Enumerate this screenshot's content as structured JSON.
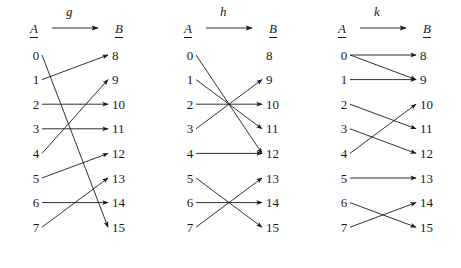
{
  "figure": {
    "domain_label": "A",
    "codomain_label": "B",
    "domain_values": [
      "0",
      "1",
      "2",
      "3",
      "4",
      "5",
      "6",
      "7"
    ],
    "codomain_values": [
      "8",
      "9",
      "10",
      "11",
      "12",
      "13",
      "14",
      "15"
    ],
    "stroke_color": "#1a1a1a",
    "background_color": "#ffffff"
  },
  "diagrams": [
    {
      "name": "g",
      "arrow_label": "g",
      "domain_label": "A",
      "codomain_label": "B",
      "domain_values": [
        "0",
        "1",
        "2",
        "3",
        "4",
        "5",
        "6",
        "7"
      ],
      "codomain_values": [
        "8",
        "9",
        "10",
        "11",
        "12",
        "13",
        "14",
        "15"
      ],
      "mappings": [
        {
          "from": "0",
          "to": "15"
        },
        {
          "from": "1",
          "to": "8"
        },
        {
          "from": "2",
          "to": "10"
        },
        {
          "from": "3",
          "to": "11"
        },
        {
          "from": "4",
          "to": "9"
        },
        {
          "from": "5",
          "to": "12"
        },
        {
          "from": "6",
          "to": "14"
        },
        {
          "from": "7",
          "to": "13"
        }
      ]
    },
    {
      "name": "h",
      "arrow_label": "h",
      "domain_label": "A",
      "codomain_label": "B",
      "domain_values": [
        "0",
        "1",
        "2",
        "3",
        "4",
        "5",
        "6",
        "7"
      ],
      "codomain_values": [
        "8",
        "9",
        "10",
        "11",
        "12",
        "13",
        "14",
        "15"
      ],
      "mappings": [
        {
          "from": "0",
          "to": "12"
        },
        {
          "from": "1",
          "to": "11"
        },
        {
          "from": "2",
          "to": "10"
        },
        {
          "from": "3",
          "to": "9"
        },
        {
          "from": "4",
          "to": "12"
        },
        {
          "from": "5",
          "to": "15"
        },
        {
          "from": "6",
          "to": "14"
        },
        {
          "from": "7",
          "to": "13"
        }
      ]
    },
    {
      "name": "k",
      "arrow_label": "k",
      "domain_label": "A",
      "codomain_label": "B",
      "domain_values": [
        "0",
        "1",
        "2",
        "3",
        "4",
        "5",
        "6",
        "7"
      ],
      "codomain_values": [
        "8",
        "9",
        "10",
        "11",
        "12",
        "13",
        "14",
        "15"
      ],
      "mappings": [
        {
          "from": "0",
          "to": "8"
        },
        {
          "from": "0",
          "to": "9"
        },
        {
          "from": "1",
          "to": "9"
        },
        {
          "from": "2",
          "to": "11"
        },
        {
          "from": "3",
          "to": "12"
        },
        {
          "from": "4",
          "to": "10"
        },
        {
          "from": "5",
          "to": "13"
        },
        {
          "from": "6",
          "to": "15"
        },
        {
          "from": "7",
          "to": "14"
        }
      ]
    }
  ]
}
